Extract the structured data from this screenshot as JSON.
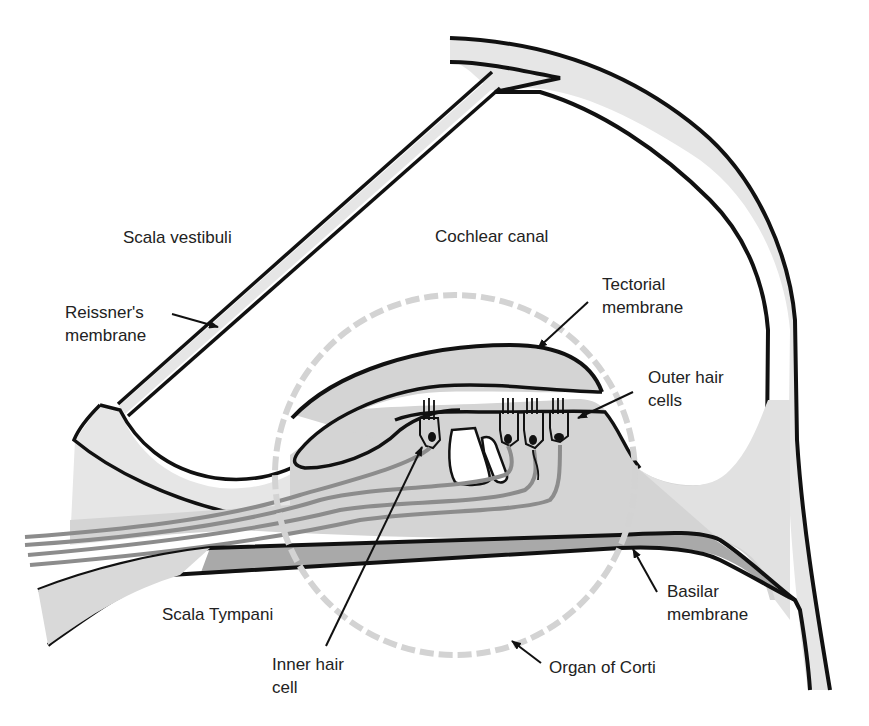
{
  "diagram": {
    "colors": {
      "outline": "#111111",
      "tissue_light": "#e6e6e6",
      "tissue_mid": "#cfcfcf",
      "tissue_dark": "#a9a9a9",
      "nerve_fibers": "#8c8c8c",
      "organ_circle": "#d3d3d3",
      "text": "#222222"
    },
    "labels": {
      "scala_vestibuli": "Scala vestibuli",
      "cochlear_canal": "Cochlear canal",
      "reissners_membrane": {
        "line1": "Reissner's",
        "line2": "membrane"
      },
      "tectorial_membrane": {
        "line1": "Tectorial",
        "line2": "membrane"
      },
      "outer_hair_cells": {
        "line1": "Outer hair",
        "line2": "cells"
      },
      "scala_tympani": "Scala Tympani",
      "inner_hair_cell": {
        "line1": "Inner hair",
        "line2": "cell"
      },
      "basilar_membrane": {
        "line1": "Basilar",
        "line2": "membrane"
      },
      "organ_of_corti": "Organ of Corti"
    },
    "structures": {
      "outer_hair_cell_count": 3,
      "inner_hair_cell_count": 1
    }
  }
}
